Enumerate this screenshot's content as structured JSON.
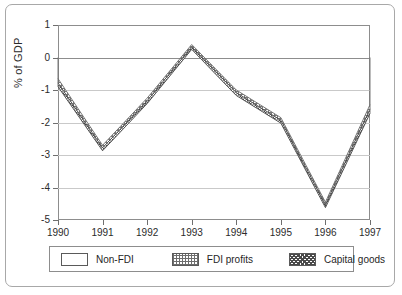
{
  "chart_data": {
    "type": "line",
    "title": "",
    "xlabel": "",
    "ylabel": "% of GDP",
    "categories": [
      "1990",
      "1991",
      "1992",
      "1993",
      "1994",
      "1995",
      "1996",
      "1997"
    ],
    "x": [
      1990,
      1991,
      1992,
      1993,
      1994,
      1995,
      1996,
      1997
    ],
    "ylim": [
      -5,
      1
    ],
    "yticks": [
      1,
      0,
      -1,
      -2,
      -3,
      -4,
      -5
    ],
    "ytick_labels": [
      "1",
      "0",
      "-1",
      "-2",
      "-3",
      "-4",
      "-5"
    ],
    "grid": true,
    "legend_position": "bottom",
    "series": [
      {
        "name": "Non-FDI",
        "swatch": "white-empty",
        "values": [
          -0.65,
          -2.7,
          -1.25,
          0.4,
          -1.0,
          -1.85,
          -4.45,
          -1.45
        ]
      },
      {
        "name": "FDI profits",
        "swatch": "grid-hatch",
        "values": [
          -0.78,
          -2.78,
          -1.33,
          0.33,
          -1.08,
          -1.93,
          -4.53,
          -1.58
        ]
      },
      {
        "name": "Capital goods",
        "swatch": "dark-checker",
        "values": [
          -0.9,
          -2.87,
          -1.42,
          0.25,
          -1.17,
          -2.02,
          -4.62,
          -1.72
        ]
      }
    ]
  },
  "axis": {
    "y_title": "% of GDP"
  },
  "legend": {
    "entries": [
      {
        "label": "Non-FDI"
      },
      {
        "label": "FDI profits"
      },
      {
        "label": "Capital goods"
      }
    ]
  }
}
